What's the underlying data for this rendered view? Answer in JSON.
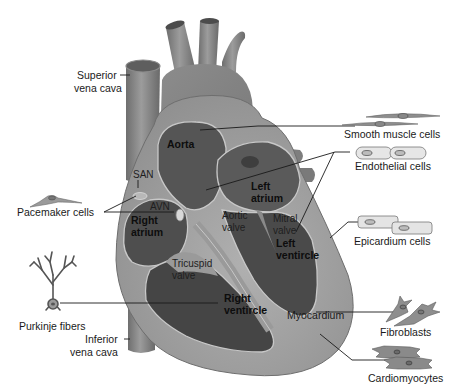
{
  "diagram": {
    "colors": {
      "background": "#ffffff",
      "vessel": "#8a8a8a",
      "vessel_dark": "#5e5e5e",
      "heart_outer": "#9a9a9a",
      "myocardium": "#a6a6a6",
      "chamber": "#505050",
      "chamber_dark": "#3e3e3e",
      "outline_light": "#c8c8c8",
      "text": "#1a1a1a"
    },
    "labels": {
      "superior_vena_cava": [
        "Superior",
        "vena cava"
      ],
      "inferior_vena_cava": [
        "Inferior",
        "vena cava"
      ],
      "aorta": "Aorta",
      "san": "SAN",
      "avn": "AVN",
      "right_atrium": [
        "Right",
        "atrium"
      ],
      "left_atrium": [
        "Left",
        "atrium"
      ],
      "aortic_valve": [
        "Aortic",
        "valve"
      ],
      "mitral_valve": [
        "Mitral",
        "valve"
      ],
      "tricuspid_valve": [
        "Tricuspid",
        "valve"
      ],
      "left_ventricle": [
        "Left",
        "ventircle"
      ],
      "right_ventricle": [
        "Right",
        "ventircle"
      ],
      "myocardium": "Myocardium"
    },
    "cell_types": [
      {
        "id": "pacemaker",
        "label": "Pacemaker cells",
        "icon": "pacemaker-cell-icon",
        "side": "left"
      },
      {
        "id": "purkinje",
        "label": "Purkinje fibers",
        "icon": "purkinje-fiber-icon",
        "side": "left"
      },
      {
        "id": "smooth_muscle",
        "label": "Smooth muscle cells",
        "icon": "smooth-muscle-cell-icon",
        "side": "right"
      },
      {
        "id": "endothelial",
        "label": "Endothelial cells",
        "icon": "endothelial-cell-icon",
        "side": "right"
      },
      {
        "id": "epicardium",
        "label": "Epicardium cells",
        "icon": "epicardium-cell-icon",
        "side": "right"
      },
      {
        "id": "fibroblasts",
        "label": "Fibroblasts",
        "icon": "fibroblast-icon",
        "side": "right"
      },
      {
        "id": "cardiomyocytes",
        "label": "Cardiomyocytes",
        "icon": "cardiomyocyte-icon",
        "side": "right"
      }
    ]
  }
}
